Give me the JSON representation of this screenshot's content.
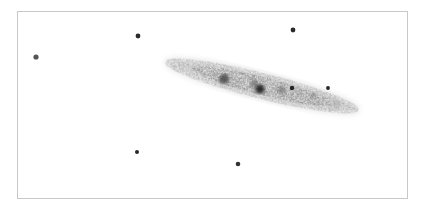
{
  "sketch": {
    "background": "#ffffff",
    "frame": {
      "x": 17,
      "y": 11,
      "width": 391,
      "height": 188,
      "color": "#c8c8c8"
    },
    "galaxy": {
      "type": "edge-on spiral",
      "center": [
        262,
        86
      ],
      "angle_deg": 14,
      "halo": {
        "rx": 100,
        "ry": 13,
        "color": "#8a8a8a",
        "opacity": 0.28
      },
      "disk": {
        "rx": 72,
        "ry": 9,
        "color": "#6a6a6a",
        "opacity": 0.45
      },
      "knots": [
        {
          "x": 224,
          "y": 79,
          "r": 5,
          "color": "#3a3a3a",
          "opacity": 0.75
        },
        {
          "x": 254,
          "y": 84,
          "r": 4,
          "color": "#555555",
          "opacity": 0.5
        },
        {
          "x": 260,
          "y": 89,
          "r": 4.5,
          "color": "#1e1e1e",
          "opacity": 0.9
        },
        {
          "x": 282,
          "y": 90,
          "r": 4,
          "color": "#555555",
          "opacity": 0.45
        },
        {
          "x": 313,
          "y": 95,
          "r": 3,
          "color": "#666666",
          "opacity": 0.4
        },
        {
          "x": 336,
          "y": 104,
          "r": 5,
          "color": "#9a9a9a",
          "opacity": 0.3
        }
      ]
    },
    "stars": [
      {
        "x": 36,
        "y": 57,
        "r": 2.6,
        "color": "#555555"
      },
      {
        "x": 138,
        "y": 36,
        "r": 2.4,
        "color": "#2a2a2a"
      },
      {
        "x": 293,
        "y": 30,
        "r": 2.4,
        "color": "#2a2a2a"
      },
      {
        "x": 292,
        "y": 88,
        "r": 2.2,
        "color": "#222222"
      },
      {
        "x": 328,
        "y": 88,
        "r": 1.9,
        "color": "#222222"
      },
      {
        "x": 137,
        "y": 152,
        "r": 2.0,
        "color": "#2a2a2a"
      },
      {
        "x": 238,
        "y": 164,
        "r": 2.3,
        "color": "#333333"
      }
    ]
  }
}
